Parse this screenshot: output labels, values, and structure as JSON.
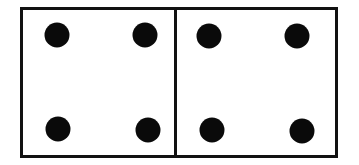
{
  "diagram": {
    "panels": [
      {
        "name": "left-panel",
        "dot_count": 4,
        "dots": [
          [
            57,
            35
          ],
          [
            145,
            35
          ],
          [
            58,
            129
          ],
          [
            148,
            130
          ]
        ]
      },
      {
        "name": "right-panel",
        "dot_count": 4,
        "dots": [
          [
            209,
            36
          ],
          [
            297,
            36
          ],
          [
            212,
            130
          ],
          [
            302,
            131
          ]
        ]
      }
    ],
    "colors": {
      "border": "#111111",
      "dot": "#0a0a0a",
      "background": "#ffffff"
    }
  }
}
